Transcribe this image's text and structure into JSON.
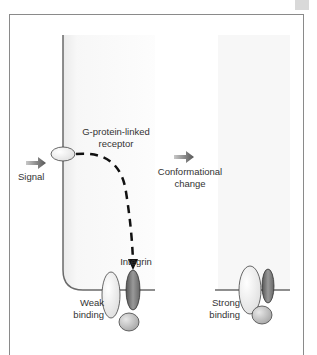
{
  "diagram": {
    "labels": {
      "signal": "Signal",
      "receptor_line1": "G-protein-linked",
      "receptor_line2": "receptor",
      "conformational_line1": "Conformational",
      "conformational_line2": "change",
      "integrin": "Integrin",
      "weak_line1": "Weak",
      "weak_line2": "binding",
      "strong_line1": "Strong",
      "strong_line2": "binding"
    },
    "colors": {
      "cell_shade": "#e9e9e9",
      "membrane": "#6a6a6a",
      "arrow_gray": "#707070",
      "integrin_dark": "#7a7a7a",
      "subunit_light": "#c8c8c8",
      "receptor_fill": "#f4f4f4"
    }
  }
}
